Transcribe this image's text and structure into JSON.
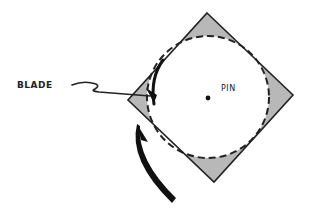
{
  "diagram": {
    "labels": {
      "blade": "BLADE",
      "pin": "PIN"
    },
    "colors": {
      "outline": "#222222",
      "fill": "#b8b8b8",
      "background": "#ffffff"
    },
    "shapes": {
      "diamond": "square rotated 45deg, gray shaded corners",
      "circle": "dashed circle inscribed in diamond",
      "pin": "center dot",
      "blade": "dark curved edge on left side of circle",
      "arrow": "curved rotation arrow below-left"
    }
  }
}
